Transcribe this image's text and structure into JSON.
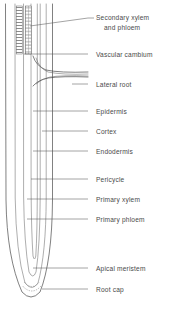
{
  "figure": {
    "subject": "root",
    "background_color": "#ffffff",
    "ink_color": "#3d3d3d",
    "text_color": "#4a4a4a",
    "leader_color": "#5a5a5a"
  },
  "labels": [
    {
      "id": "secondary-xylem-and-phloem",
      "line1": "Secondary xylem",
      "line2": "and phloem",
      "text_x": 96,
      "line1_y": 18,
      "line2_y": 28,
      "two_line": true,
      "leader": {
        "x1": 88,
        "y1": 18,
        "x2": 30,
        "y2": 26
      },
      "dash_x1": 88,
      "dash_x2": 94,
      "dash_y": 18
    },
    {
      "id": "vascular-cambium",
      "line1": "Vascular cambium",
      "line2": "",
      "text_x": 96,
      "line1_y": 56,
      "two_line": false,
      "leader": {
        "x1": 88,
        "y1": 54,
        "x2": 24,
        "y2": 54
      },
      "dash_x1": 88,
      "dash_x2": 94,
      "dash_y": 54
    },
    {
      "id": "lateral-root",
      "line1": "Lateral root",
      "line2": "",
      "text_x": 96,
      "line1_y": 86,
      "two_line": false,
      "leader": {
        "x1": 88,
        "y1": 84,
        "x2": 70,
        "y2": 84
      },
      "dash_x1": 88,
      "dash_x2": 94,
      "dash_y": 84
    },
    {
      "id": "epidermis",
      "line1": "Epidermis",
      "line2": "",
      "text_x": 96,
      "line1_y": 113,
      "two_line": false,
      "leader": {
        "x1": 88,
        "y1": 111,
        "x2": 33,
        "y2": 111
      },
      "dash_x1": 88,
      "dash_x2": 94,
      "dash_y": 111
    },
    {
      "id": "cortex",
      "line1": "Cortex",
      "line2": "",
      "text_x": 96,
      "line1_y": 133,
      "two_line": false,
      "leader": {
        "x1": 88,
        "y1": 131,
        "x2": 42,
        "y2": 131
      },
      "dash_x1": 88,
      "dash_x2": 94,
      "dash_y": 131
    },
    {
      "id": "endodermis",
      "line1": "Endodermis",
      "line2": "",
      "text_x": 96,
      "line1_y": 153,
      "two_line": false,
      "leader": {
        "x1": 88,
        "y1": 151,
        "x2": 33,
        "y2": 151
      },
      "dash_x1": 88,
      "dash_x2": 94,
      "dash_y": 151
    },
    {
      "id": "pericycle",
      "line1": "Pericycle",
      "line2": "",
      "text_x": 96,
      "line1_y": 181,
      "two_line": false,
      "leader": {
        "x1": 88,
        "y1": 179,
        "x2": 31,
        "y2": 179
      },
      "dash_x1": 88,
      "dash_x2": 94,
      "dash_y": 179
    },
    {
      "id": "primary-xylem",
      "line1": "Primary xylem",
      "line2": "",
      "text_x": 96,
      "line1_y": 201,
      "two_line": false,
      "leader": {
        "x1": 88,
        "y1": 199,
        "x2": 27,
        "y2": 199
      },
      "dash_x1": 88,
      "dash_x2": 94,
      "dash_y": 199
    },
    {
      "id": "primary-phloem",
      "line1": "Primary phloem",
      "line2": "",
      "text_x": 96,
      "line1_y": 221,
      "two_line": false,
      "leader": {
        "x1": 88,
        "y1": 219,
        "x2": 27,
        "y2": 219
      },
      "dash_x1": 88,
      "dash_x2": 94,
      "dash_y": 219
    },
    {
      "id": "apical-meristem",
      "line1": "Apical meristem",
      "line2": "",
      "text_x": 96,
      "line1_y": 270,
      "two_line": false,
      "leader": {
        "x1": 88,
        "y1": 268,
        "x2": 33,
        "y2": 268
      },
      "dash_x1": 88,
      "dash_x2": 94,
      "dash_y": 268
    },
    {
      "id": "root-cap",
      "line1": "Root cap",
      "line2": "",
      "text_x": 96,
      "line1_y": 291,
      "two_line": false,
      "leader": {
        "x1": 88,
        "y1": 289,
        "x2": 42,
        "y2": 289
      },
      "dash_x1": 88,
      "dash_x2": 94,
      "dash_y": 289
    }
  ],
  "structures": {
    "epidermis_outline": "M 5.5 4 L 6.0 200 Q 6.8 258 22 292 Q 31 302 40 292 Q 52 262 52.5 200 L 52.5 4",
    "cortex_outline": "M 15.0 4 L 15.2 198 Q 16.0 252 25 283 Q 32 292 38 283 Q 46 254 46.2 198 L 46.2 4",
    "endodermis_outline": "M 23.5 4 L 23.6 196 Q 24.2 244 29 272 Q 33 280 36 272 Q 40 246 40.2 196 L 40.2 4",
    "pericycle_outline": "M 31.0 4 L 31.1 192 Q 31.4 232 33 256 Q 34.5 262 35.8 256 Q 37.2 234 37.3 192 L 37.3 4",
    "root_cap_dash": "M 22.5 286 Q 32 296 41 286",
    "root_cap_dash2": "M 24.5 282 Q 32 291 39.5 282",
    "lateral_root_upper": "M 33 56 Q 36 66 46 70 Q 60 73 88 72",
    "lateral_root_lower": "M 33 86 Q 38 80 48 78 Q 62 76 88 77",
    "lateral_root_inner_upper": "M 36 58 Q 39 68 48 72 Q 62 75 88 74",
    "lateral_root_inner_lower": "M 36 84 Q 41 79 50 77 Q 63 75 88 76"
  },
  "vascular_bands": [
    {
      "id": "band-secondary-xylem",
      "x": 16.2,
      "y": 6,
      "width": 6.0,
      "height": 48
    },
    {
      "id": "band-secondary-phloem",
      "x": 25.2,
      "y": 6,
      "width": 6.0,
      "height": 48
    }
  ]
}
